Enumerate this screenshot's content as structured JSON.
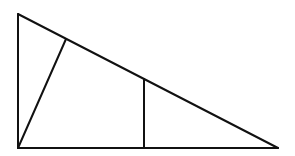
{
  "diagram": {
    "type": "geometry",
    "stroke_color": "#111111",
    "background_color": "#ffffff",
    "points": {
      "top_left": [
        18,
        14
      ],
      "bottom_left": [
        18,
        148
      ],
      "bottom_right": [
        278,
        148
      ],
      "cevian_foot": [
        66,
        39
      ],
      "vertical_top": [
        144,
        79
      ],
      "vertical_bottom": [
        144,
        148
      ]
    },
    "segments": [
      {
        "name": "left-leg",
        "from": "top_left",
        "to": "bottom_left"
      },
      {
        "name": "base",
        "from": "bottom_left",
        "to": "bottom_right"
      },
      {
        "name": "hypotenuse",
        "from": "top_left",
        "to": "bottom_right"
      },
      {
        "name": "cevian",
        "from": "bottom_left",
        "to": "cevian_foot"
      },
      {
        "name": "vertical-segment",
        "from": "vertical_bottom",
        "to": "vertical_top"
      }
    ],
    "labels": []
  }
}
